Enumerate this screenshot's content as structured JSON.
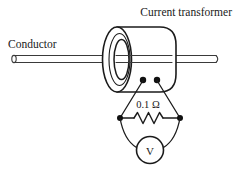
{
  "figure": {
    "kind": "schematic",
    "caption_title": "Current transformer",
    "conductor_label": "Conductor",
    "resistor_label": "0.1 Ω",
    "meter_label": "V",
    "colors": {
      "line": "#1b1b1b",
      "rod": "#3a3a3a",
      "fill": "#ffffff",
      "text": "#1a1a1a",
      "node": "#101010"
    },
    "components": [
      {
        "name": "conductor-rod",
        "label": "Conductor"
      },
      {
        "name": "current-transformer-core",
        "label": "Current transformer"
      },
      {
        "name": "terminal-dot-left",
        "label": ""
      },
      {
        "name": "terminal-dot-right",
        "label": ""
      },
      {
        "name": "burden-resistor",
        "label": "0.1 Ω"
      },
      {
        "name": "voltmeter",
        "label": "V"
      }
    ]
  }
}
